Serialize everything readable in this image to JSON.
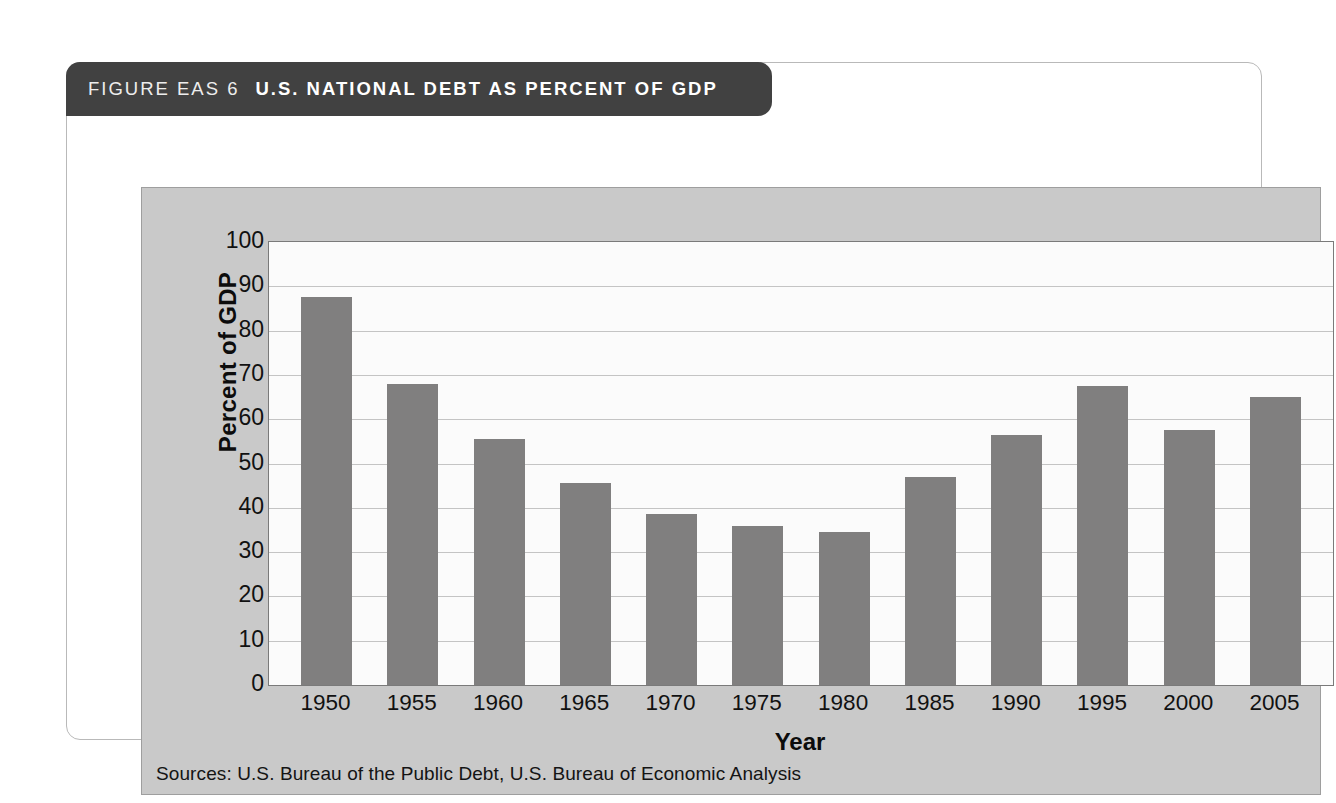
{
  "figure": {
    "label": "FIGURE EAS 6",
    "title": "U.S. NATIONAL DEBT AS PERCENT OF GDP",
    "source_note": "Sources: U.S. Bureau of the Public Debt, U.S. Bureau of Economic Analysis"
  },
  "colors": {
    "title_band": "#414141",
    "panel": "#c9c9c9",
    "plot_background": "#fbfbfb",
    "bar": "#807f7f",
    "gridline": "#c4c4c4",
    "axis": "#7a7a7a",
    "text": "#111111"
  },
  "chart_data": {
    "type": "bar",
    "title": "U.S. NATIONAL DEBT AS PERCENT OF GDP",
    "xlabel": "Year",
    "ylabel": "Percent of GDP",
    "categories": [
      "1950",
      "1955",
      "1960",
      "1965",
      "1970",
      "1975",
      "1980",
      "1985",
      "1990",
      "1995",
      "2000",
      "2005"
    ],
    "values": [
      87.5,
      68,
      55.5,
      45.5,
      38.5,
      36,
      34.5,
      47,
      56.5,
      67.5,
      57.5,
      65
    ],
    "ylim": [
      0,
      100
    ],
    "yticks": [
      100,
      90,
      80,
      70,
      60,
      50,
      40,
      30,
      20,
      10,
      0
    ],
    "grid": true,
    "legend": "none"
  }
}
